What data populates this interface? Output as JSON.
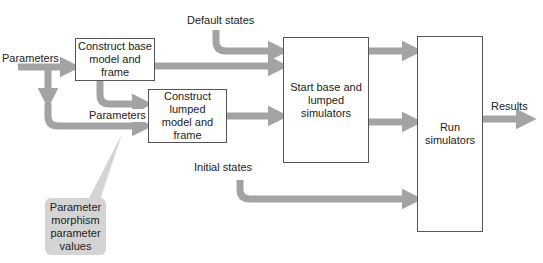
{
  "diagram": {
    "colors": {
      "arrow": "#a3a3a3",
      "box_border": "#555555",
      "callout_fill": "#d4d4d4",
      "text": "#222222"
    },
    "inputs": {
      "parameters_main": "Parameters",
      "parameters_lumped": "Parameters",
      "default_states": "Default states",
      "initial_states": "Initial states"
    },
    "boxes": {
      "construct_base": "Construct base\nmodel and frame",
      "construct_lumped": "Construct\nlumped\nmodel and frame",
      "start_simulators": "Start base and\nlumped\nsimulators",
      "run_simulators": "Run\nsimulators"
    },
    "outputs": {
      "results": "Results"
    },
    "callout": {
      "text": "Parameter\nmorphism\nparameter\nvalues"
    }
  }
}
